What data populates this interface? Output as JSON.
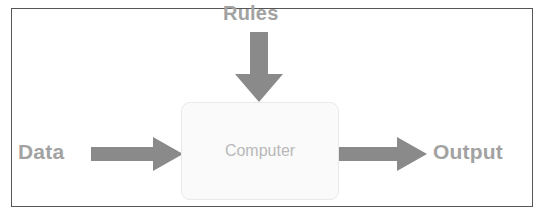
{
  "diagram": {
    "frame": {
      "border_color": "#565656",
      "background": "#ffffff"
    },
    "labels": {
      "rules": "Rules",
      "data": "Data",
      "output": "Output"
    },
    "process_box": {
      "label": "Computer",
      "fill": "#fafafa",
      "border_color": "#e9e9e9",
      "text_color": "#b8b8b8"
    },
    "arrows": [
      {
        "name": "rules-to-computer",
        "direction": "down",
        "from": "Rules",
        "to": "Computer",
        "color": "#8a8a8a"
      },
      {
        "name": "data-to-computer",
        "direction": "right",
        "from": "Data",
        "to": "Computer",
        "color": "#8a8a8a"
      },
      {
        "name": "computer-to-output",
        "direction": "right",
        "from": "Computer",
        "to": "Output",
        "color": "#8a8a8a"
      }
    ],
    "colors": {
      "label_text": "#a2a2a2",
      "arrow": "#8a8a8a",
      "frame_border": "#565656"
    }
  }
}
